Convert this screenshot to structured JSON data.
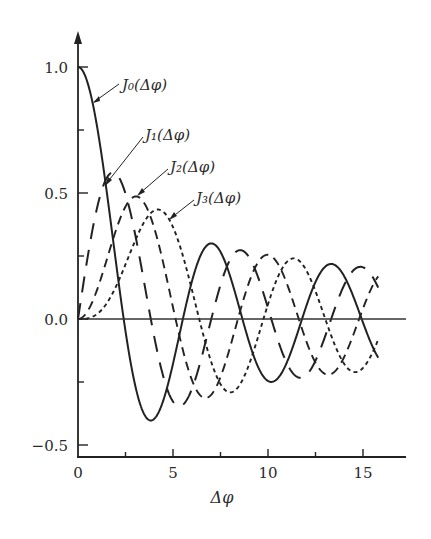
{
  "chart_data": {
    "type": "line",
    "title": "",
    "xlabel": "Δφ",
    "ylabel": "",
    "xlim": [
      0,
      17
    ],
    "ylim": [
      -0.55,
      1.15
    ],
    "x_ticks_major": [
      0,
      5,
      10,
      15
    ],
    "x_ticks_minor": [
      2.5,
      7.5,
      12.5
    ],
    "x_tick_labels": [
      "0",
      "5",
      "10",
      "15"
    ],
    "y_ticks_major": [
      -0.5,
      0.0,
      0.5,
      1.0
    ],
    "y_ticks_minor": [
      -0.25,
      0.25,
      0.75
    ],
    "y_tick_labels": [
      "−0.5",
      "0.0",
      "0.5",
      "1.0"
    ],
    "grid": false,
    "legend": "inline annotations with leader arrows",
    "x_range_plotted": [
      0,
      15.8
    ],
    "series": [
      {
        "name": "J0(Δφ)",
        "label": "J₀(Δφ)",
        "order": 0,
        "style": "solid",
        "x": [
          0,
          1,
          2,
          2.405,
          3,
          3.832,
          4,
          5,
          5.52,
          6,
          7,
          7.016,
          8,
          8.654,
          9,
          10,
          10.17,
          11,
          11.79,
          12,
          13,
          13.32,
          14,
          14.93,
          15,
          15.8
        ],
        "values": [
          1.0,
          0.765,
          0.224,
          0.0,
          -0.26,
          -0.403,
          -0.397,
          -0.178,
          0.0,
          0.151,
          0.3,
          0.3,
          0.172,
          0.0,
          -0.09,
          -0.246,
          -0.25,
          -0.171,
          0.0,
          0.048,
          0.207,
          0.218,
          0.171,
          0.0,
          -0.014,
          -0.13
        ]
      },
      {
        "name": "J1(Δφ)",
        "label": "J₁(Δφ)",
        "order": 1,
        "style": "long-dash",
        "x": [
          0,
          1,
          1.841,
          2,
          3,
          3.832,
          4,
          5,
          5.331,
          6,
          7,
          7.016,
          8,
          8.536,
          9,
          10,
          10.17,
          11,
          11.71,
          12,
          13,
          13.32,
          14,
          15,
          15.8
        ],
        "values": [
          0.0,
          0.44,
          0.582,
          0.577,
          0.339,
          0.0,
          -0.066,
          -0.328,
          -0.346,
          -0.277,
          -0.005,
          0.0,
          0.235,
          0.273,
          0.245,
          0.043,
          0.0,
          -0.177,
          -0.232,
          -0.223,
          -0.07,
          0.0,
          0.133,
          0.205,
          0.16
        ]
      },
      {
        "name": "J2(Δφ)",
        "label": "J₂(Δφ)",
        "order": 2,
        "style": "medium-dash",
        "x": [
          0,
          1,
          2,
          3,
          3.054,
          4,
          5,
          5.136,
          6,
          6.706,
          7,
          8,
          8.417,
          9,
          9.969,
          10,
          11,
          11.62,
          12,
          13,
          13.17,
          14,
          14.8,
          15,
          15.8
        ],
        "values": [
          0.0,
          0.115,
          0.353,
          0.486,
          0.486,
          0.364,
          0.047,
          0.0,
          -0.243,
          -0.303,
          -0.301,
          -0.113,
          0.0,
          0.145,
          0.254,
          0.255,
          0.139,
          0.0,
          -0.085,
          -0.218,
          -0.221,
          -0.152,
          0.0,
          0.041,
          0.17
        ]
      },
      {
        "name": "J3(Δφ)",
        "label": "J₃(Δφ)",
        "order": 3,
        "style": "short-dash",
        "x": [
          0,
          1,
          2,
          3,
          4,
          4.201,
          5,
          6,
          6.38,
          7,
          8,
          8.015,
          9,
          9.761,
          10,
          11,
          11.35,
          12,
          13,
          13.02,
          14,
          14.59,
          15,
          15.8
        ],
        "values": [
          0.0,
          0.02,
          0.129,
          0.309,
          0.43,
          0.434,
          0.365,
          0.115,
          0.0,
          -0.168,
          -0.291,
          -0.291,
          -0.181,
          0.0,
          0.058,
          0.227,
          0.25,
          0.195,
          0.0,
          0.0,
          -0.177,
          -0.2,
          -0.194,
          -0.02
        ]
      }
    ]
  },
  "annotations": [
    {
      "series": "J0",
      "text": "J₀(Δφ)"
    },
    {
      "series": "J1",
      "text": "J₁(Δφ)"
    },
    {
      "series": "J2",
      "text": "J₂(Δφ)"
    },
    {
      "series": "J3",
      "text": "J₃(Δφ)"
    }
  ],
  "axes": {
    "x_label": "Δφ",
    "x_tick_labels": [
      "0",
      "5",
      "10",
      "15"
    ],
    "y_tick_labels": [
      "1.0",
      "0.5",
      "0.0",
      "−0.5"
    ]
  }
}
